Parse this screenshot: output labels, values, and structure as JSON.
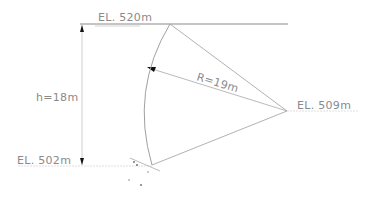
{
  "diagram": {
    "type": "slope-section",
    "labels": {
      "top_elevation": "EL. 520m",
      "mid_elevation": "EL. 509m",
      "bottom_elevation": "EL. 502m",
      "height": "h=18m",
      "radius": "R=19m"
    },
    "colors": {
      "line": "#a8a8a8",
      "text": "#8a8a8a",
      "arrow": "#111111"
    }
  }
}
